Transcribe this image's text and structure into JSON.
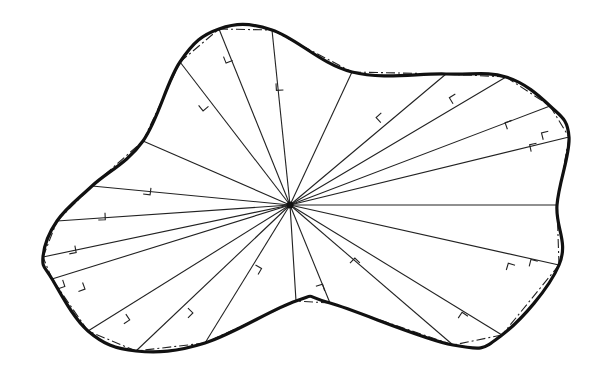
{
  "diagram": {
    "title": "",
    "colors": {
      "line": "#222222",
      "outline": "#111111",
      "background": "#ffffff"
    },
    "center": [
      290,
      205
    ],
    "boundary_points": [
      [
        180,
        62
      ],
      [
        219,
        29
      ],
      [
        272,
        30
      ],
      [
        352,
        72
      ],
      [
        446,
        74
      ],
      [
        506,
        77
      ],
      [
        550,
        106
      ],
      [
        569,
        137
      ],
      [
        557,
        205
      ],
      [
        559,
        265
      ],
      [
        502,
        335
      ],
      [
        453,
        345
      ],
      [
        330,
        303
      ],
      [
        296,
        301
      ],
      [
        205,
        343
      ],
      [
        136,
        351
      ],
      [
        88,
        331
      ],
      [
        52,
        279
      ],
      [
        43,
        257
      ],
      [
        57,
        221
      ],
      [
        92,
        186
      ],
      [
        143,
        141
      ]
    ],
    "right_angle_marks": [
      [
        230,
        54
      ],
      [
        204,
        101
      ],
      [
        283,
        83
      ],
      [
        386,
        118
      ],
      [
        459,
        100
      ],
      [
        514,
        127
      ],
      [
        550,
        138
      ],
      [
        538,
        150
      ],
      [
        144,
        187
      ],
      [
        98,
        213
      ],
      [
        68,
        247
      ],
      [
        56,
        282
      ],
      [
        76,
        285
      ],
      [
        120,
        318
      ],
      [
        183,
        313
      ],
      [
        252,
        271
      ],
      [
        318,
        293
      ],
      [
        355,
        268
      ],
      [
        464,
        322
      ],
      [
        513,
        272
      ],
      [
        536,
        268
      ]
    ]
  }
}
